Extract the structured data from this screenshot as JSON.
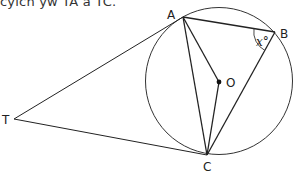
{
  "caption": "cyich yw TA a TC.",
  "diagram": {
    "points": {
      "A": "A",
      "B": "B",
      "C": "C",
      "O": "O",
      "T": "T"
    },
    "angle_label": "x°",
    "colors": {
      "line": "#222222",
      "circle": "#333333",
      "background": "#ffffff"
    }
  }
}
